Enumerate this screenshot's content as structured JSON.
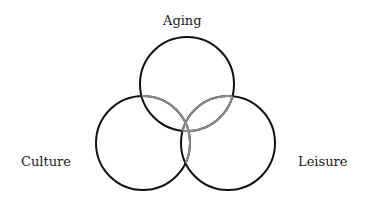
{
  "diagram": {
    "type": "venn",
    "sets": [
      {
        "name": "Aging",
        "cx": 187,
        "cy": 84,
        "r": 47
      },
      {
        "name": "Culture",
        "cx": 143,
        "cy": 143,
        "r": 47
      },
      {
        "name": "Leisure",
        "cx": 228,
        "cy": 143,
        "r": 47
      }
    ],
    "labels": {
      "aging": "Aging",
      "culture": "Culture",
      "leisure": "Leisure"
    },
    "colors": {
      "outline": "#111111",
      "overlap_arc": "#8a8a8a",
      "background": "#ffffff"
    }
  }
}
